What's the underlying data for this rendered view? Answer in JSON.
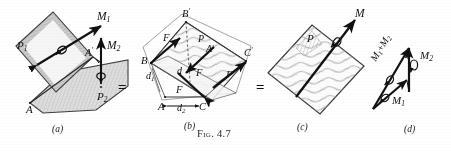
{
  "figure": {
    "caption": "Fig. 4.7",
    "equals_signs": [
      "=",
      "="
    ],
    "panels": [
      {
        "id": "a",
        "label": "(a)",
        "description": "Two intersecting planes P1 and P2 with couple moment vectors M1 and M2 applied at A' along edge A-A'",
        "labels": [
          {
            "name": "plane-p1-label",
            "base": "P",
            "sub": "1"
          },
          {
            "name": "plane-p2-label",
            "base": "P",
            "sub": "2"
          },
          {
            "name": "moment-m1-label",
            "base": "M",
            "sub": "1"
          },
          {
            "name": "moment-m2-label",
            "base": "M",
            "sub": "2"
          },
          {
            "name": "point-a-label",
            "base": "A",
            "sub": ""
          },
          {
            "name": "point-a-prime-label",
            "base": "A",
            "sup": "′"
          }
        ]
      },
      {
        "id": "b",
        "label": "(b)",
        "description": "Equivalent force couples F acting on the two planes through points A, B, C, A', B', C' with moment arms d1, d, d2",
        "labels": [
          {
            "name": "point-b-label",
            "base": "B",
            "sup": ""
          },
          {
            "name": "point-b-prime-label",
            "base": "B",
            "sup": "′"
          },
          {
            "name": "point-c-label",
            "base": "C",
            "sup": ""
          },
          {
            "name": "point-c-prime-label",
            "base": "C",
            "sup": "′"
          },
          {
            "name": "point-a-label",
            "base": "A",
            "sup": ""
          },
          {
            "name": "point-a-prime-label",
            "base": "A",
            "sup": "′"
          },
          {
            "name": "plane-p-label",
            "base": "P",
            "sup": ""
          },
          {
            "name": "force-f-label-1",
            "base": "F",
            "sup": ""
          },
          {
            "name": "force-f-label-2",
            "base": "F",
            "sup": ""
          },
          {
            "name": "force-f-label-3",
            "base": "F",
            "sup": ""
          },
          {
            "name": "force-f-label-4",
            "base": "F",
            "sup": ""
          },
          {
            "name": "distance-d1-label",
            "base": "d",
            "sub": "1"
          },
          {
            "name": "distance-d-label",
            "base": "d",
            "sub": ""
          },
          {
            "name": "distance-d2-label",
            "base": "d",
            "sub": "2"
          }
        ],
        "dimension_line": {
          "name": "d2-dimension",
          "left": "A",
          "value_base": "d",
          "value_sub": "2",
          "right": "C"
        }
      },
      {
        "id": "c",
        "label": "(c)",
        "description": "Single resultant plane P with resultant couple moment vector M",
        "labels": [
          {
            "name": "plane-p-label",
            "base": "P",
            "sup": ""
          },
          {
            "name": "resultant-moment-m-label",
            "base": "M",
            "sup": ""
          }
        ]
      },
      {
        "id": "d",
        "label": "(d)",
        "description": "Vector triangle showing the resultant M1 + M2 formed from moment vectors M1 and M2",
        "labels": [
          {
            "name": "vector-sum-label",
            "base": "M",
            "sub": "1",
            "operator": "+",
            "base2": "M",
            "sub2": "2"
          },
          {
            "name": "vector-m2-label",
            "base": "M",
            "sub": "2"
          },
          {
            "name": "vector-m1-label",
            "base": "M",
            "sub": "1"
          }
        ]
      }
    ]
  },
  "colors": {
    "ink": "#1a1a1a",
    "line": "#3a3a3a",
    "hatch": "#8d8d8d",
    "shade_p1": "#cfcfcf",
    "shade_p2": "#dcdcdc",
    "paper": "#ffffff"
  }
}
